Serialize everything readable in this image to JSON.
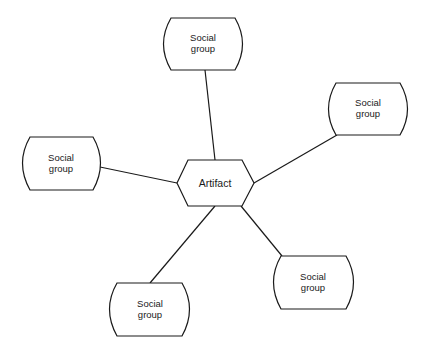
{
  "diagram": {
    "type": "hub-and-spoke",
    "center": {
      "id": "artifact",
      "label": "Artifact",
      "shape": "hexagon"
    },
    "nodes": [
      {
        "id": "sg-top",
        "label": "Social\ngroup",
        "shape": "rounded-barrel",
        "position": "top"
      },
      {
        "id": "sg-right",
        "label": "Social\ngroup",
        "shape": "rounded-barrel",
        "position": "upper-right"
      },
      {
        "id": "sg-left",
        "label": "Social\ngroup",
        "shape": "rounded-barrel",
        "position": "left"
      },
      {
        "id": "sg-bottom-left",
        "label": "Social\ngroup",
        "shape": "rounded-barrel",
        "position": "bottom-left"
      },
      {
        "id": "sg-bottom-right",
        "label": "Social\ngroup",
        "shape": "rounded-barrel",
        "position": "lower-right"
      }
    ],
    "edges": [
      {
        "from": "artifact",
        "to": "sg-top"
      },
      {
        "from": "artifact",
        "to": "sg-right"
      },
      {
        "from": "artifact",
        "to": "sg-left"
      },
      {
        "from": "artifact",
        "to": "sg-bottom-left"
      },
      {
        "from": "artifact",
        "to": "sg-bottom-right"
      }
    ],
    "colors": {
      "stroke": "#1a1a1a",
      "background": "#ffffff"
    }
  }
}
